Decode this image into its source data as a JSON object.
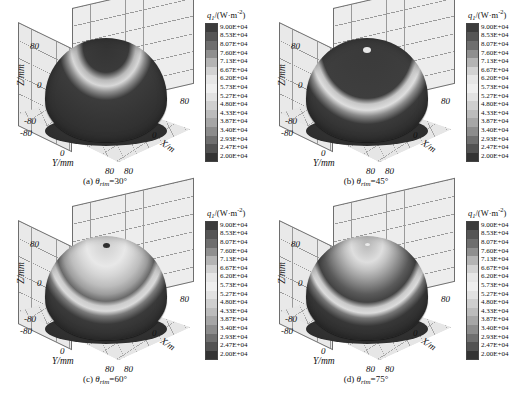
{
  "figure": {
    "type": "3d-surface-grid",
    "panel_count": 4
  },
  "colorbar": {
    "title_symbol": "q",
    "title_sub": "1",
    "title_units": "/(W·m",
    "title_exp": "-2",
    "title_close": ")",
    "min": 20000,
    "max": 90000,
    "band_count": 16,
    "labels": [
      "9.00E+04",
      "8.53E+04",
      "8.07E+04",
      "7.60E+04",
      "7.13E+04",
      "6.67E+04",
      "6.20E+04",
      "5.73E+04",
      "5.27E+04",
      "4.80E+04",
      "4.33E+04",
      "3.87E+04",
      "3.40E+04",
      "2.93E+04",
      "2.47E+04",
      "2.00E+04"
    ],
    "values": [
      90000,
      85300,
      80700,
      76000,
      71300,
      66700,
      62000,
      57300,
      52700,
      48000,
      43300,
      38700,
      34000,
      29300,
      24700,
      20000
    ],
    "colors": [
      "#3c3c3c",
      "#555555",
      "#6e6e6e",
      "#8f8f8f",
      "#b4b4b4",
      "#d2d2d2",
      "#e6e6e6",
      "#efefef",
      "#e2e2e2",
      "#cfcfcf",
      "#bcbcbc",
      "#a6a6a6",
      "#8c8c8c",
      "#6f6f6f",
      "#525252",
      "#333333"
    ]
  },
  "axes": {
    "x": {
      "label": "X/m",
      "ticks": [
        "80",
        "0"
      ]
    },
    "y": {
      "label": "Y/mm",
      "ticks": [
        "-80",
        "0",
        "80"
      ]
    },
    "z": {
      "label": "Z/mm",
      "ticks": [
        "80",
        "0",
        "-80"
      ]
    },
    "corner_tick": "80"
  },
  "panels": [
    {
      "id": "a",
      "caption_index": "(a)",
      "caption_symbol": "θ",
      "caption_sub": "rim",
      "caption_value": "=30°",
      "rim_angle_deg": 30,
      "apex_color": "#3c3c3c",
      "apex_visible": false,
      "surface_bands": [
        {
          "stop": 0,
          "color": "#343434"
        },
        {
          "stop": 26,
          "color": "#3a3a3a"
        },
        {
          "stop": 34,
          "color": "#b9b9b9"
        },
        {
          "stop": 40,
          "color": "#d8d8d8"
        },
        {
          "stop": 46,
          "color": "#8e8e8e"
        },
        {
          "stop": 54,
          "color": "#3c3c3c"
        },
        {
          "stop": 100,
          "color": "#2c2c2c"
        }
      ]
    },
    {
      "id": "b",
      "caption_index": "(b)",
      "caption_symbol": "θ",
      "caption_sub": "rim",
      "caption_value": "=45°",
      "rim_angle_deg": 45,
      "apex_color": "#e8e8e8",
      "apex_visible": true,
      "surface_bands": [
        {
          "stop": 0,
          "color": "#3a3a3a"
        },
        {
          "stop": 30,
          "color": "#3c3c3c"
        },
        {
          "stop": 52,
          "color": "#3e3e3e"
        },
        {
          "stop": 58,
          "color": "#c6c6c6"
        },
        {
          "stop": 64,
          "color": "#dedede"
        },
        {
          "stop": 70,
          "color": "#8a8a8a"
        },
        {
          "stop": 78,
          "color": "#3a3a3a"
        },
        {
          "stop": 100,
          "color": "#2b2b2b"
        }
      ]
    },
    {
      "id": "c",
      "caption_index": "(c)",
      "caption_symbol": "θ",
      "caption_sub": "rim",
      "caption_value": "=60°",
      "rim_angle_deg": 60,
      "apex_color": "#2e2e2e",
      "apex_visible": true,
      "surface_bands": [
        {
          "stop": 0,
          "color": "#cfcfcf"
        },
        {
          "stop": 12,
          "color": "#dcdcdc"
        },
        {
          "stop": 22,
          "color": "#e8e8e8"
        },
        {
          "stop": 32,
          "color": "#d5d5d5"
        },
        {
          "stop": 42,
          "color": "#bdbdbd"
        },
        {
          "stop": 50,
          "color": "#9d9d9d"
        },
        {
          "stop": 57,
          "color": "#6a6a6a"
        },
        {
          "stop": 62,
          "color": "#cccccc"
        },
        {
          "stop": 67,
          "color": "#dadada"
        },
        {
          "stop": 72,
          "color": "#7a7a7a"
        },
        {
          "stop": 80,
          "color": "#3a3a3a"
        },
        {
          "stop": 100,
          "color": "#2c2c2c"
        }
      ]
    },
    {
      "id": "d",
      "caption_index": "(d)",
      "caption_symbol": "θ",
      "caption_sub": "rim",
      "caption_value": "=75°",
      "rim_angle_deg": 75,
      "apex_color": "#ededed",
      "apex_visible": true,
      "surface_bands": [
        {
          "stop": 0,
          "color": "#b9b9b9"
        },
        {
          "stop": 10,
          "color": "#cdcdcd"
        },
        {
          "stop": 18,
          "color": "#dedede"
        },
        {
          "stop": 26,
          "color": "#c3c3c3"
        },
        {
          "stop": 34,
          "color": "#a2a2a2"
        },
        {
          "stop": 42,
          "color": "#7f7f7f"
        },
        {
          "stop": 50,
          "color": "#5a5a5a"
        },
        {
          "stop": 58,
          "color": "#434343"
        },
        {
          "stop": 64,
          "color": "#c9c9c9"
        },
        {
          "stop": 69,
          "color": "#dcdcdc"
        },
        {
          "stop": 74,
          "color": "#767676"
        },
        {
          "stop": 82,
          "color": "#373737"
        },
        {
          "stop": 100,
          "color": "#2a2a2a"
        }
      ]
    }
  ]
}
